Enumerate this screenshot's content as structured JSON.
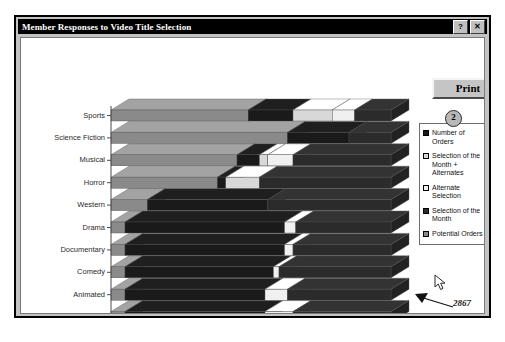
{
  "window": {
    "title": "Member Responses to Video Title Selection",
    "help_button": "?",
    "close_button": "✕"
  },
  "toolbar": {
    "print_label": "Print"
  },
  "legend": {
    "items": [
      {
        "label": "Number of Orders",
        "color": "#1a1a1a",
        "swatch": "solid-dark"
      },
      {
        "label": "Selection of the Month + Alternates",
        "color": "#d8d8d8",
        "swatch": "light"
      },
      {
        "label": "Alternate Selection",
        "color": "#f0f0f0",
        "swatch": "lightest"
      },
      {
        "label": "Selection of the Month",
        "color": "#2b2b2b",
        "swatch": "dark"
      },
      {
        "label": "Potential Orders",
        "color": "#8a8a8a",
        "swatch": "mid-gray"
      }
    ]
  },
  "markers": {
    "one": "1",
    "two": "2",
    "three": "3"
  },
  "annotation": {
    "value_label": "2867"
  },
  "chart_data": {
    "type": "bar",
    "orientation": "horizontal",
    "stacked": true,
    "title": "",
    "xlabel": "",
    "ylabel": "",
    "xlim": [
      0,
      100
    ],
    "xticks": [
      "0%",
      "20%",
      "40%",
      "60%",
      "80%",
      "100%"
    ],
    "xtick_values": [
      0,
      20,
      40,
      60,
      80,
      100
    ],
    "grid": false,
    "legend_position": "right",
    "categories": [
      "Sports",
      "Science Fiction",
      "Musical",
      "Horror",
      "Western",
      "Drama",
      "Documentary",
      "Comedy",
      "Animated",
      "Action Adventure"
    ],
    "series": [
      {
        "name": "Potential Orders",
        "color": "#8a8a8a",
        "values": [
          49,
          63,
          45,
          38,
          13,
          5,
          5,
          5,
          5,
          5
        ]
      },
      {
        "name": "Number of Orders",
        "color": "#1a1a1a",
        "values": [
          16,
          22,
          8,
          3,
          43,
          57,
          57,
          53,
          50,
          50
        ]
      },
      {
        "name": "Selection of the Month + Alternates",
        "color": "#d8d8d8",
        "values": [
          14,
          0,
          3,
          12,
          0,
          0,
          0,
          0,
          0,
          0
        ]
      },
      {
        "name": "Alternate Selection",
        "color": "#f0f0f0",
        "values": [
          8,
          0,
          9,
          0,
          0,
          4,
          3,
          2,
          8,
          10
        ]
      },
      {
        "name": "Selection of the Month",
        "color": "#2b2b2b",
        "values": [
          13,
          15,
          35,
          47,
          44,
          34,
          35,
          40,
          37,
          35
        ]
      }
    ]
  }
}
